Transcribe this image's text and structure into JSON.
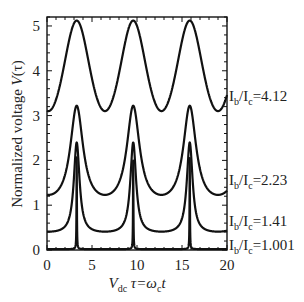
{
  "chart_data": {
    "type": "line",
    "title": "",
    "xlabel": "V_dc τ = ω_c t",
    "ylabel": "Normalized voltage V(τ)",
    "xlim": [
      0,
      20
    ],
    "ylim": [
      0,
      5.2
    ],
    "xticks": [
      0,
      5,
      10,
      15,
      20
    ],
    "yticks": [
      0,
      1,
      2,
      3,
      4,
      5
    ],
    "grid": false,
    "legend_position": "inline-right",
    "peak_positions": [
      3.3,
      9.6,
      15.9
    ],
    "period": 6.28,
    "series": [
      {
        "name": "I_b/I_c=4.12",
        "ratio": "4.12",
        "vmin": 3.1,
        "vmax": 5.12,
        "sharpness": 0.08
      },
      {
        "name": "I_b/I_c=2.23",
        "ratio": "2.23",
        "vmin": 1.23,
        "vmax": 3.22,
        "sharpness": 0.42
      },
      {
        "name": "I_b/I_c=1.41",
        "ratio": "1.41",
        "vmin": 0.41,
        "vmax": 2.4,
        "sharpness": 0.68
      },
      {
        "name": "I_b/I_c=1.001",
        "ratio": "1.001",
        "vmin": 0.02,
        "vmax": 2.07,
        "sharpness": 0.975
      }
    ]
  },
  "axes": {
    "x_title_main": "V",
    "x_title_sub": "dc",
    "x_title_rest": " τ=ω",
    "x_title_sub2": "c",
    "x_title_end": "t",
    "y_title_main": "Normalized voltage ",
    "y_title_italic": "V",
    "y_title_end": "(τ)"
  },
  "labels": {
    "prefix_I": "I",
    "sub_b": "b",
    "slash": "/I",
    "sub_c": "c",
    "eq": "="
  }
}
